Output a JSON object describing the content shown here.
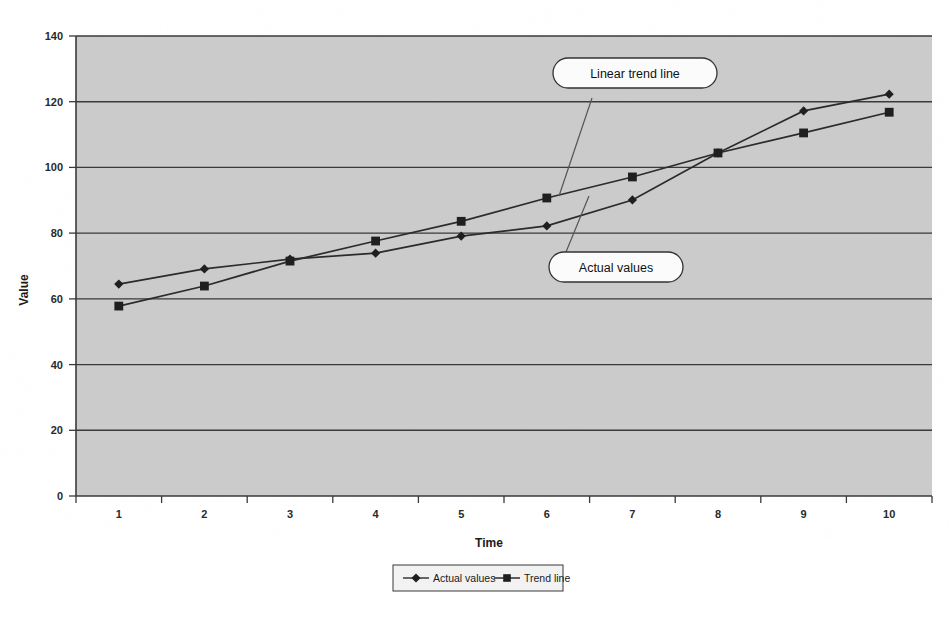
{
  "chart_data": {
    "type": "line",
    "title": "",
    "xlabel": "Time",
    "ylabel": "Value",
    "x": [
      1,
      2,
      3,
      4,
      5,
      6,
      7,
      8,
      9,
      10
    ],
    "xtick_labels": [
      "1",
      "2",
      "3",
      "4",
      "5",
      "6",
      "7",
      "8",
      "9",
      "10"
    ],
    "ytick_labels": [
      "0",
      "20",
      "40",
      "60",
      "80",
      "100",
      "120",
      "140"
    ],
    "yticks": [
      0,
      20,
      40,
      60,
      80,
      100,
      120,
      140
    ],
    "ylim": [
      0,
      140
    ],
    "grid": "horizontal",
    "legend_position": "bottom-center",
    "plot_background": "#d4d4d4",
    "series": [
      {
        "name": "Actual values",
        "marker": "diamond",
        "color": "#2b2b2b",
        "values": [
          64.5,
          69.1,
          72.1,
          73.9,
          79.1,
          82.2,
          90.1,
          104.4,
          117.2,
          122.3
        ]
      },
      {
        "name": "Trend line",
        "marker": "square",
        "color": "#1f1f1f",
        "values": [
          57.8,
          63.9,
          71.5,
          77.6,
          83.6,
          90.7,
          97.1,
          104.4,
          110.5,
          116.8
        ]
      }
    ],
    "annotations": [
      {
        "id": "linear-trend-line",
        "text": "Linear trend line",
        "points_to_series": "Trend line"
      },
      {
        "id": "actual-values",
        "text": "Actual values",
        "points_to_series": "Actual values"
      }
    ],
    "legend_entries": [
      {
        "label": "Actual values",
        "marker": "diamond"
      },
      {
        "label": "Trend line",
        "marker": "square"
      }
    ]
  }
}
